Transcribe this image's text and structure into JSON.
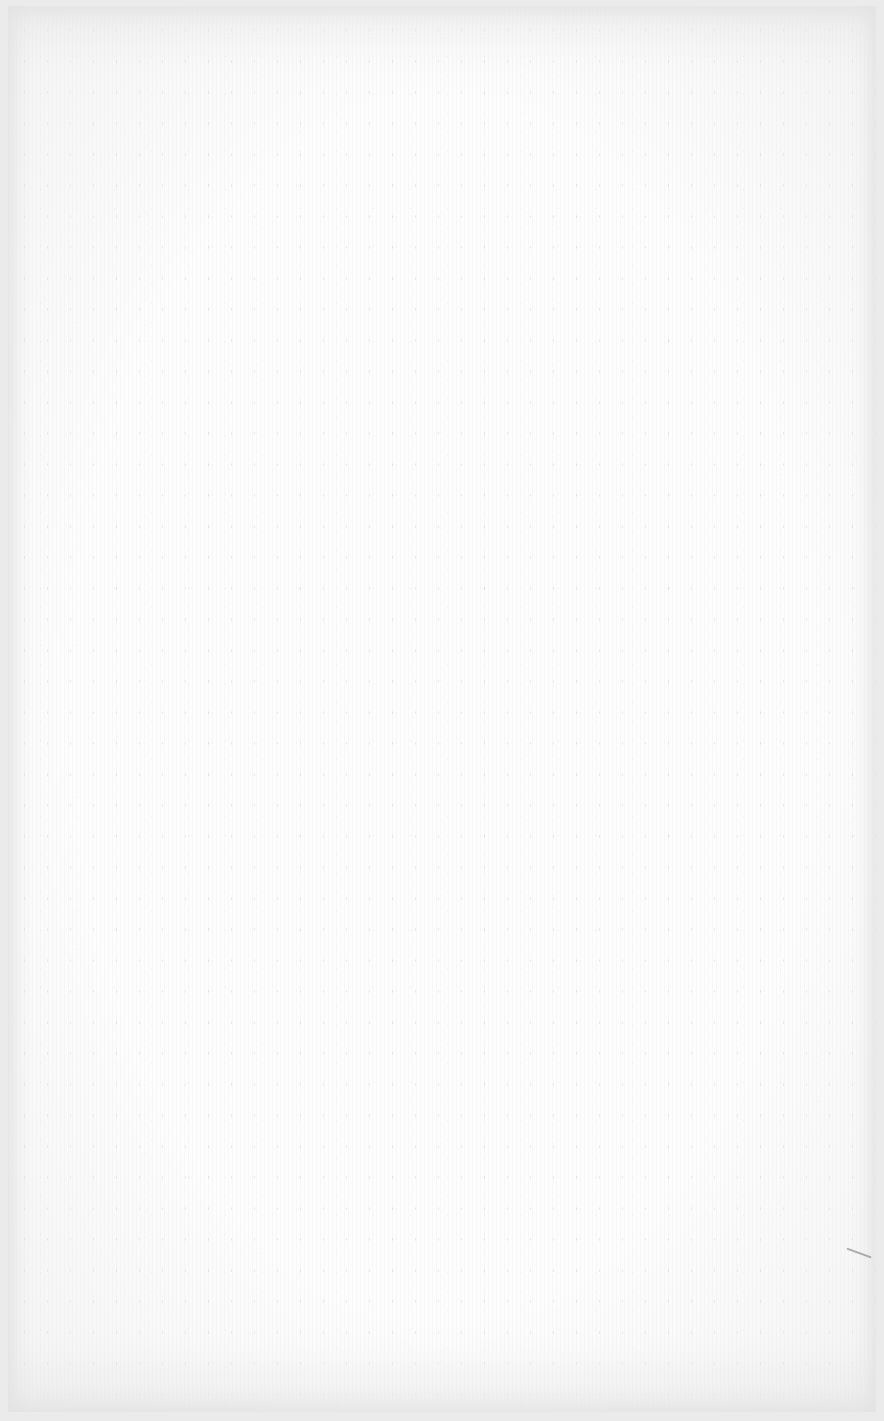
{
  "page": {
    "type": "blank-paper-texture",
    "text_content": [],
    "colors": {
      "paper": "#fdfdfd",
      "border": "#ebebeb",
      "speckle": "#8c8c8c"
    }
  }
}
